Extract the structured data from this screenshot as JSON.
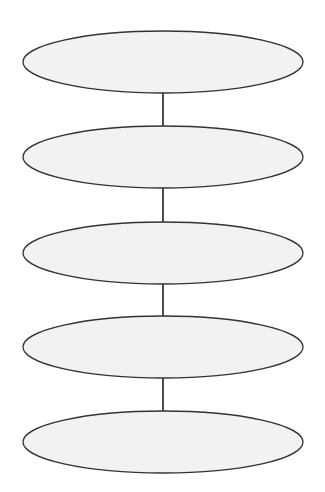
{
  "diagram": {
    "type": "vertical-chain",
    "canvas": {
      "width": 325,
      "height": 492,
      "background": "#ffffff"
    },
    "style": {
      "node_fill": "#f2f2f2",
      "node_stroke": "#333333",
      "node_stroke_width": 1.3,
      "edge_stroke": "#222222",
      "edge_stroke_width": 1.6
    },
    "nodes": [
      {
        "id": "node-1",
        "shape": "ellipse",
        "cx": 163,
        "cy": 62,
        "rx": 140,
        "ry": 31,
        "label": ""
      },
      {
        "id": "node-2",
        "shape": "ellipse",
        "cx": 163,
        "cy": 157,
        "rx": 140,
        "ry": 31,
        "label": ""
      },
      {
        "id": "node-3",
        "shape": "ellipse",
        "cx": 163,
        "cy": 253,
        "rx": 140,
        "ry": 31,
        "label": ""
      },
      {
        "id": "node-4",
        "shape": "ellipse",
        "cx": 163,
        "cy": 347,
        "rx": 140,
        "ry": 31,
        "label": ""
      },
      {
        "id": "node-5",
        "shape": "ellipse",
        "cx": 163,
        "cy": 442,
        "rx": 140,
        "ry": 31,
        "label": ""
      }
    ],
    "edges": [
      {
        "from": "node-1",
        "to": "node-2",
        "x": 163,
        "y1": 93,
        "y2": 126
      },
      {
        "from": "node-2",
        "to": "node-3",
        "x": 163,
        "y1": 188,
        "y2": 222
      },
      {
        "from": "node-3",
        "to": "node-4",
        "x": 163,
        "y1": 284,
        "y2": 316
      },
      {
        "from": "node-4",
        "to": "node-5",
        "x": 163,
        "y1": 378,
        "y2": 411
      }
    ]
  }
}
